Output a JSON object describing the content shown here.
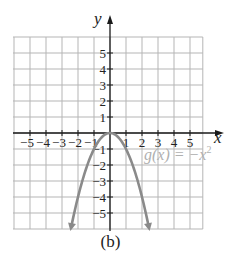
{
  "chart_data": {
    "type": "line",
    "title": "",
    "caption": "(b)",
    "xlabel": "x",
    "ylabel": "y",
    "xlim": [
      -6,
      5.8
    ],
    "ylim": [
      -6,
      6
    ],
    "grid": true,
    "x_ticks": [
      -5,
      -4,
      -3,
      -2,
      -1,
      1,
      2,
      3,
      4,
      5
    ],
    "y_ticks": [
      5,
      4,
      3,
      2,
      1,
      -1,
      -2,
      -3,
      -4,
      -5
    ],
    "x_tick_labels": [
      "−5",
      "−4",
      "−3",
      "−2",
      "−1",
      "1",
      "2",
      "3",
      "4",
      "5"
    ],
    "y_tick_labels": [
      "5",
      "4",
      "3",
      "2",
      "1",
      "−1",
      "−2",
      "−3",
      "−4",
      "−5"
    ],
    "series": [
      {
        "name": "g(x) = −x²",
        "function": "-x^2",
        "domain": [
          -2.4,
          2.4
        ],
        "arrows_at_ends": true,
        "color": "#8a8a8a",
        "x": [
          -2.4,
          -2,
          -1.5,
          -1,
          -0.5,
          0,
          0.5,
          1,
          1.5,
          2,
          2.4
        ],
        "y": [
          -5.76,
          -4,
          -2.25,
          -1,
          -0.25,
          0,
          -0.25,
          -1,
          -2.25,
          -4,
          -5.76
        ]
      }
    ],
    "annotations": [
      {
        "text": "g(x) = −x²",
        "x": 2.3,
        "y": -1.5,
        "color": "#b0b0b0"
      }
    ]
  },
  "labels": {
    "x_axis": "x",
    "y_axis": "y",
    "function_label_prefix": "g(x) = −x",
    "function_label_exp": "2",
    "caption": "(b)"
  },
  "colors": {
    "grid": "#b5b5b5",
    "axis": "#1a1a1a",
    "curve": "#8a8a8a",
    "label": "#b0b0b0",
    "text": "#222222"
  }
}
